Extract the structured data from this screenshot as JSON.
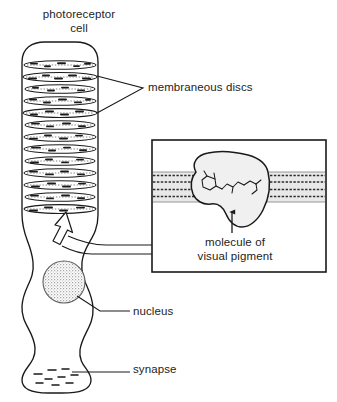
{
  "figure": {
    "kind": "biological-diagram",
    "subject": "photoreceptor cell",
    "background_color": "#ffffff",
    "ink_color": "#1a1a1a"
  },
  "labels": {
    "title": "photoreceptor\ncell",
    "membraneous_discs": "membraneous discs",
    "molecule_of_visual_pigment": "molecule of\nvisual pigment",
    "nucleus": "nucleus",
    "synapse": "synapse"
  },
  "cell": {
    "outer_segment": {
      "name": "outer segment",
      "disc_count": 13,
      "disc_fill": "#ffffff",
      "disc_stroke": "#1a1a1a"
    },
    "nucleus": {
      "shape": "circle",
      "fill": "stippled-gray",
      "fill_color": "#b9b9b9"
    },
    "synapse": {
      "vesicle_dash_count": 9
    }
  },
  "inset": {
    "name": "membrane detail inset",
    "border_color": "#1a1a1a",
    "background": "#ffffff",
    "membrane": {
      "name": "lipid bilayer band",
      "band_fill": "#e2e2e2",
      "dotted_row_count": 4
    },
    "pigment_molecule": {
      "name": "visual pigment protein",
      "fill": "#efefef",
      "stroke": "#1a1a1a",
      "contains": "retinal chromophore"
    }
  },
  "connectors": {
    "discs_bracket": "V-shaped bracket from disc stack to membraneous discs label",
    "inset_arrow": "hollow arrow from bottom disc leading into inset",
    "nucleus_leader": "leader line from nucleus to nucleus label",
    "synapse_leader": "leader line from synapse to synapse label",
    "pigment_arrow": "arrow from label up to pigment molecule"
  }
}
